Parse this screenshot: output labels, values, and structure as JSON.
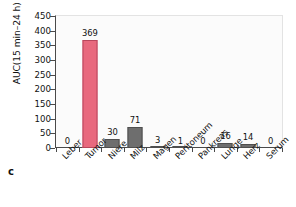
{
  "panel": {
    "letter": "c"
  },
  "chart_data": {
    "type": "bar",
    "title": "",
    "subtitle": "",
    "xlabel": "",
    "ylabel": "AUC(15 min–24 h) µg/g*min",
    "ylim": [
      0,
      450
    ],
    "yticks": [
      0,
      50,
      100,
      150,
      200,
      250,
      300,
      350,
      400,
      450
    ],
    "grid": false,
    "legend": null,
    "categories": [
      "Leber",
      "Tumor",
      "Niere",
      "Milz",
      "Magen",
      "Peritoneum",
      "Pankreas",
      "Lunge",
      "Herz",
      "Serum"
    ],
    "values": [
      0,
      369,
      30,
      71,
      3,
      1,
      0,
      16,
      14,
      0
    ],
    "value_labels": [
      "0",
      "369",
      "30",
      "71",
      "3",
      "1",
      "0",
      "16",
      "14",
      "0"
    ],
    "highlight_category": "Tumor",
    "colors": {
      "bar_default": "#6e6e6e",
      "bar_default_edge": "#4f4f4f",
      "bar_highlight": "#e8697e",
      "bar_highlight_edge": "#b8475c",
      "axis": "#4a4a4a",
      "plot_background": "#fbfbfb",
      "text": "#111111"
    }
  }
}
